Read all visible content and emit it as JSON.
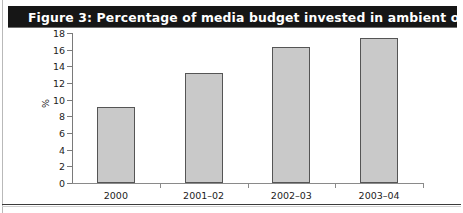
{
  "figure": {
    "title": "Figure 3: Percentage of media budget invested in ambient over time",
    "banner_color": "#161616",
    "banner_text_color": "#ffffff"
  },
  "chart_data": {
    "type": "bar",
    "title": "Figure 3: Percentage of media budget invested in ambient over time",
    "categories": [
      "2000",
      "2001–02",
      "2002–03",
      "2003–04"
    ],
    "values": [
      9.1,
      13.2,
      16.3,
      17.4
    ],
    "xlabel": "",
    "ylabel": "%",
    "ylim": [
      0,
      18
    ],
    "yticks": [
      0,
      2,
      4,
      6,
      8,
      10,
      12,
      14,
      16,
      18
    ],
    "ytick_labels": [
      "0",
      "2",
      "4",
      "6",
      "8",
      "10",
      "12",
      "14",
      "16",
      "18"
    ],
    "grid": false,
    "legend": null,
    "bar_fill_color": "#c9c9c9",
    "bar_edge_color": "#555555",
    "axis_color": "#7a7a7a"
  }
}
